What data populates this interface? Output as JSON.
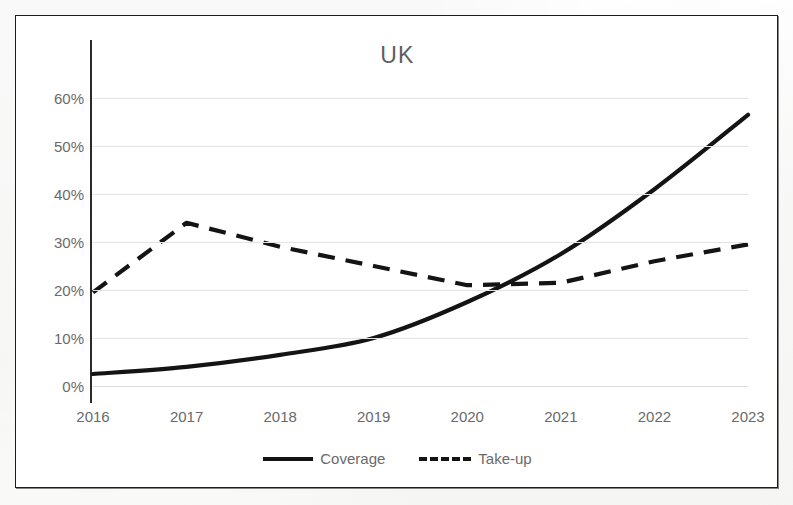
{
  "chart_data": {
    "type": "line",
    "title": "UK",
    "xlabel": "",
    "ylabel": "",
    "x": [
      2016,
      2017,
      2018,
      2019,
      2020,
      2021,
      2022,
      2023
    ],
    "xtick_labels": [
      "2016",
      "2017",
      "2018",
      "2019",
      "2020",
      "2021",
      "2022",
      "2023"
    ],
    "ytick_labels": [
      "60%",
      "50%",
      "40%",
      "30%",
      "20%",
      "10%",
      "0%"
    ],
    "ytick_values": [
      60,
      50,
      40,
      30,
      20,
      10,
      0
    ],
    "ylim": [
      0,
      60
    ],
    "xlim": [
      2016,
      2023
    ],
    "grid": true,
    "legend_position": "bottom",
    "series": [
      {
        "name": "Coverage",
        "style": "solid",
        "color": "#141414",
        "values": [
          2.5,
          4.0,
          6.5,
          10.0,
          17.5,
          27.5,
          41.0,
          56.5
        ]
      },
      {
        "name": "Take-up",
        "style": "dashed",
        "color": "#141414",
        "values": [
          19.5,
          34.0,
          29.0,
          25.0,
          21.0,
          21.5,
          26.0,
          29.5
        ]
      }
    ],
    "annotations": []
  },
  "chart": {
    "title": "UK"
  },
  "legend": {
    "items": [
      {
        "label": "Coverage",
        "style": "solid"
      },
      {
        "label": "Take-up",
        "style": "dashed"
      }
    ]
  },
  "caption": {
    "text": ""
  }
}
